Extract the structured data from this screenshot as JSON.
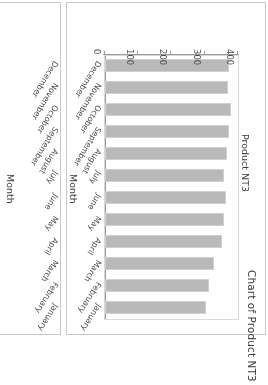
{
  "page": {
    "background": "#ffffff",
    "orientation_note": "content rendered rotated 180 degrees"
  },
  "colors": {
    "bar_fill": "#b9b9b9",
    "bar_border": "#cfcfcf",
    "axis": "#9a9a9a",
    "plot_border": "#d8d8d8",
    "panel_border": "#c8c8c8",
    "text": "#3a3a3a",
    "tick_text": "#4a4a4a"
  },
  "main_panel": {
    "title": "Chart of Product NT3",
    "xlabel": "Month",
    "ylabel": "Product NT3"
  },
  "side_panel": {
    "xlabel": "Month"
  },
  "chart_data": {
    "type": "bar",
    "title": "Chart of Product NT3",
    "xlabel": "Month",
    "ylabel": "Product NT3",
    "categories": [
      "January",
      "February",
      "March",
      "April",
      "May",
      "June",
      "July",
      "August",
      "September",
      "October",
      "November",
      "December"
    ],
    "values": [
      303,
      312,
      328,
      352,
      358,
      365,
      357,
      366,
      372,
      378,
      370,
      373
    ],
    "ylim": [
      0,
      400
    ],
    "yticks": [
      0,
      100,
      200,
      300,
      400
    ],
    "ytick_labels": [
      "0",
      "100",
      "200",
      "300",
      "400"
    ],
    "grid": false,
    "legend": null,
    "orientation": "vertical",
    "series": [
      {
        "name": "Product NT3",
        "values": [
          303,
          312,
          328,
          352,
          358,
          365,
          357,
          366,
          372,
          378,
          370,
          373
        ]
      }
    ]
  },
  "side_chart_data": {
    "type": "bar",
    "note_visible": "only category axis labels visible; plot area cropped off-screen",
    "categories": [
      "January",
      "February",
      "March",
      "April",
      "May",
      "June",
      "July",
      "August",
      "September",
      "October",
      "November",
      "December"
    ],
    "xlabel": "Month"
  }
}
